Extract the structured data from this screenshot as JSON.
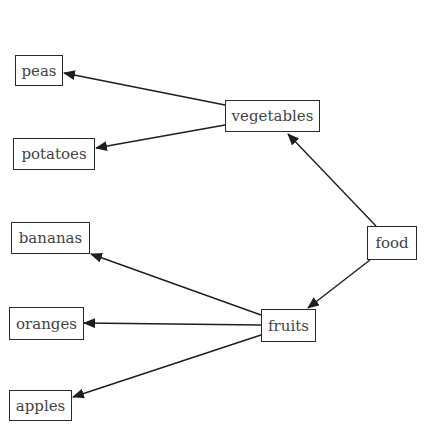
{
  "diagram": {
    "type": "tree",
    "direction": "right-to-left",
    "root": "food",
    "nodes": [
      {
        "id": "food",
        "label": "food",
        "x": 367,
        "y": 226,
        "w": 50,
        "h": 34
      },
      {
        "id": "vegetables",
        "label": "vegetables",
        "x": 225,
        "y": 100,
        "w": 95,
        "h": 32
      },
      {
        "id": "fruits",
        "label": "fruits",
        "x": 261,
        "y": 309,
        "w": 55,
        "h": 33
      },
      {
        "id": "peas",
        "label": "peas",
        "x": 15,
        "y": 55,
        "w": 48,
        "h": 31
      },
      {
        "id": "potatoes",
        "label": "potatoes",
        "x": 13,
        "y": 138,
        "w": 82,
        "h": 32
      },
      {
        "id": "bananas",
        "label": "bananas",
        "x": 11,
        "y": 222,
        "w": 79,
        "h": 32
      },
      {
        "id": "oranges",
        "label": "oranges",
        "x": 9,
        "y": 307,
        "w": 75,
        "h": 33
      },
      {
        "id": "apples",
        "label": "apples",
        "x": 9,
        "y": 390,
        "w": 63,
        "h": 31
      }
    ],
    "edges": [
      {
        "from": "food",
        "to": "vegetables",
        "x1": 376,
        "y1": 226,
        "x2": 288,
        "y2": 134
      },
      {
        "from": "food",
        "to": "fruits",
        "x1": 370,
        "y1": 260,
        "x2": 308,
        "y2": 308
      },
      {
        "from": "vegetables",
        "to": "peas",
        "x1": 225,
        "y1": 105,
        "x2": 64,
        "y2": 73
      },
      {
        "from": "vegetables",
        "to": "potatoes",
        "x1": 225,
        "y1": 125,
        "x2": 96,
        "y2": 148
      },
      {
        "from": "fruits",
        "to": "bananas",
        "x1": 261,
        "y1": 315,
        "x2": 91,
        "y2": 254
      },
      {
        "from": "fruits",
        "to": "oranges",
        "x1": 261,
        "y1": 325,
        "x2": 84,
        "y2": 323
      },
      {
        "from": "fruits",
        "to": "apples",
        "x1": 261,
        "y1": 335,
        "x2": 73,
        "y2": 397
      }
    ]
  }
}
